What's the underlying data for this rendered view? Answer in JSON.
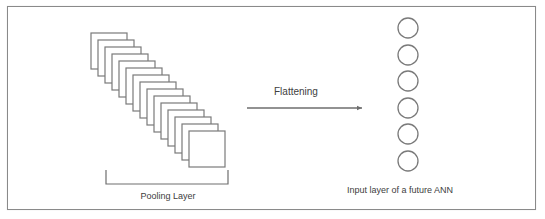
{
  "diagram": {
    "pooling_layer": {
      "label": "Pooling Layer",
      "feature_map_count": 15,
      "feature_map_size": 36,
      "first_map_origin": [
        91,
        33
      ],
      "step": [
        7,
        7
      ]
    },
    "flattening": {
      "label": "Flattening",
      "arrow": {
        "x1": 247,
        "y1": 108,
        "x2": 362,
        "y2": 108
      }
    },
    "input_layer": {
      "label": "Input layer of a future ANN",
      "node_count": 6,
      "node_center_x": 408,
      "node_centers_y": [
        28,
        55,
        81,
        108,
        134,
        161
      ],
      "node_radius": 10
    },
    "colors": {
      "stroke": "#7a7a7a",
      "text": "#404040",
      "frame": "#8a8a8a",
      "background": "#ffffff"
    }
  }
}
